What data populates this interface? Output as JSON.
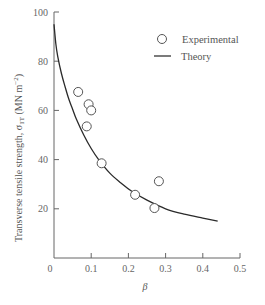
{
  "chart_data": {
    "type": "scatter",
    "title": "",
    "xlabel": "β",
    "ylabel": "Transverse tensile strength, σ₁T (MN m⁻²)",
    "xlim": [
      0,
      0.5
    ],
    "ylim": [
      0,
      100
    ],
    "x_ticks": [
      "0",
      "0.1",
      "0.2",
      "0.3",
      "0.4",
      "0.5"
    ],
    "y_ticks": [
      "20",
      "40",
      "60",
      "80",
      "100"
    ],
    "grid": false,
    "legend_position": "upper right",
    "legend": [
      {
        "label": "Experimental",
        "marker": "open-circle"
      },
      {
        "label": "Theory",
        "marker": "line"
      }
    ],
    "series": [
      {
        "name": "Experimental",
        "kind": "scatter",
        "x": [
          0.065,
          0.093,
          0.1,
          0.088,
          0.128,
          0.218,
          0.27,
          0.282
        ],
        "y": [
          67.5,
          62.5,
          60,
          53.5,
          38.5,
          25.7,
          20.3,
          31.2
        ]
      },
      {
        "name": "Theory",
        "kind": "line",
        "x": [
          0.0,
          0.005,
          0.01,
          0.02,
          0.03,
          0.04,
          0.05,
          0.06,
          0.08,
          0.1,
          0.12,
          0.15,
          0.18,
          0.21,
          0.25,
          0.3,
          0.35,
          0.4,
          0.44
        ],
        "y": [
          95,
          87,
          82,
          75,
          69.5,
          64.5,
          60.5,
          56.5,
          50,
          44.5,
          40,
          34.5,
          30.5,
          27,
          23.5,
          20,
          17.8,
          16.2,
          15
        ]
      }
    ]
  },
  "labels": {
    "x_axis": "β",
    "y_axis_main": "Transverse tensile strength, σ",
    "y_axis_sub": "1T",
    "y_axis_units": " (MN m",
    "y_axis_exp": "−2",
    "y_axis_close": ")",
    "legend_experimental": "Experimental",
    "legend_theory": "Theory"
  }
}
